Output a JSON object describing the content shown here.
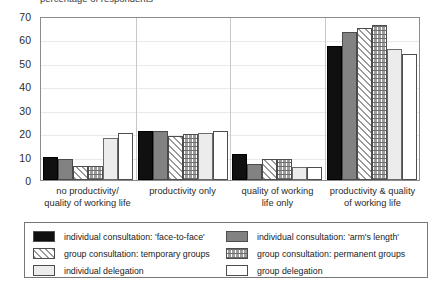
{
  "title_partial": "percentage of respondents",
  "chart_data": {
    "type": "bar",
    "title": "percentage of respondents",
    "xlabel": "",
    "ylabel": "",
    "ylim": [
      0,
      70
    ],
    "yticks": [
      0,
      10,
      20,
      30,
      40,
      50,
      60,
      70
    ],
    "grid": true,
    "legend_position": "bottom",
    "categories": [
      "no productivity/\nquality of working life",
      "productivity only",
      "quality of working\nlife only",
      "productivity & quality\nof working life"
    ],
    "series": [
      {
        "name": "individual consultation: 'face-to-face'",
        "values": [
          10,
          21,
          11,
          57
        ]
      },
      {
        "name": "individual consultation: 'arm's length'",
        "values": [
          9,
          21,
          7,
          63
        ]
      },
      {
        "name": "group consultation: temporary groups",
        "values": [
          6,
          19,
          9,
          65
        ]
      },
      {
        "name": "group consultation: permanent groups",
        "values": [
          6,
          19.5,
          9,
          66
        ]
      },
      {
        "name": "individual delegation",
        "values": [
          18,
          20,
          5.5,
          56
        ]
      },
      {
        "name": "group delegation",
        "values": [
          20,
          21,
          5.5,
          54
        ]
      }
    ]
  },
  "axis": {
    "y_tick_labels": [
      "70",
      "60",
      "50",
      "40",
      "30",
      "20",
      "10",
      "0"
    ]
  },
  "xaxis": {
    "labels": [
      {
        "line1": "no productivity/",
        "line2": "quality of working life"
      },
      {
        "line1": "productivity only",
        "line2": ""
      },
      {
        "line1": "quality of working",
        "line2": "life only"
      },
      {
        "line1": "productivity & quality",
        "line2": "of working life"
      }
    ]
  },
  "legend": {
    "entries": [
      {
        "label": "individual consultation: 'face-to-face'",
        "pattern": "solid-black",
        "color": "#101010"
      },
      {
        "label": "individual consultation: 'arm's length'",
        "pattern": "solid-gray",
        "color": "#828282"
      },
      {
        "label": "group consultation: temporary groups",
        "pattern": "diagonal-stripes",
        "color": "#9a9a9a"
      },
      {
        "label": "group consultation: permanent groups",
        "pattern": "brick-checker",
        "color": "#9c9c9c"
      },
      {
        "label": "individual delegation",
        "pattern": "light-gray",
        "color": "#ececec"
      },
      {
        "label": "group delegation",
        "pattern": "white",
        "color": "#ffffff"
      }
    ]
  }
}
